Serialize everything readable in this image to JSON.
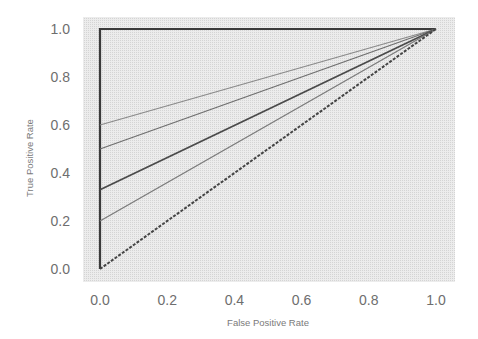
{
  "chart_data": {
    "type": "line",
    "title": "",
    "xlabel": "False Positive Rate",
    "ylabel": "True Positive Rate",
    "xlim": [
      0.0,
      1.0
    ],
    "ylim": [
      0.0,
      1.0
    ],
    "xticks": [
      "0.0",
      "0.2",
      "0.4",
      "0.6",
      "0.8",
      "1.0"
    ],
    "yticks": [
      "0.0",
      "0.2",
      "0.4",
      "0.6",
      "0.8",
      "1.0"
    ],
    "grid": false,
    "legend": null,
    "background": "#e6e6e6",
    "series": [
      {
        "name": "perfect-classifier",
        "x": [
          0.0,
          0.0,
          1.0
        ],
        "y": [
          0.0,
          1.0,
          1.0
        ],
        "color": "#3a3a3a",
        "width": 2.2,
        "style": "solid"
      },
      {
        "name": "roc-intercept-0.6",
        "x": [
          0.0,
          1.0
        ],
        "y": [
          0.6,
          1.0
        ],
        "color": "#8a8a8a",
        "width": 1.2,
        "style": "solid"
      },
      {
        "name": "roc-intercept-0.5",
        "x": [
          0.0,
          1.0
        ],
        "y": [
          0.5,
          1.0
        ],
        "color": "#6e6e6e",
        "width": 1.3,
        "style": "solid"
      },
      {
        "name": "roc-intercept-0.33",
        "x": [
          0.0,
          1.0
        ],
        "y": [
          0.33,
          1.0
        ],
        "color": "#4a4a4a",
        "width": 1.8,
        "style": "solid"
      },
      {
        "name": "roc-intercept-0.2",
        "x": [
          0.0,
          1.0
        ],
        "y": [
          0.2,
          1.0
        ],
        "color": "#7a7a7a",
        "width": 1.2,
        "style": "solid"
      },
      {
        "name": "random-classifier",
        "x": [
          0.0,
          1.0
        ],
        "y": [
          0.0,
          1.0
        ],
        "color": "#444444",
        "width": 2.0,
        "style": "dashed"
      }
    ]
  }
}
